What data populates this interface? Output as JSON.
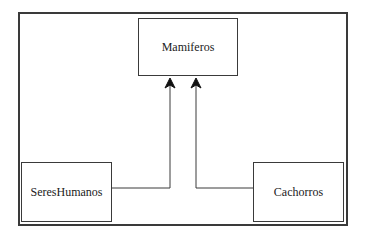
{
  "diagram": {
    "type": "class-inheritance",
    "nodes": [
      {
        "id": "mamiferos",
        "label": "Mamiferos"
      },
      {
        "id": "sereshumanos",
        "label": "SeresHumanos"
      },
      {
        "id": "cachorros",
        "label": "Cachorros"
      }
    ],
    "edges": [
      {
        "from": "sereshumanos",
        "to": "mamiferos",
        "arrow": "open-arrow"
      },
      {
        "from": "cachorros",
        "to": "mamiferos",
        "arrow": "open-arrow"
      }
    ],
    "colors": {
      "line": "#3a3a3a",
      "background": "#ffffff"
    }
  }
}
